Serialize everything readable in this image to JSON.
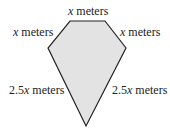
{
  "diagram": {
    "shape": "pentagon",
    "fill": "#e3e3e3",
    "stroke": "#222222",
    "vertices": [
      [
        70,
        21
      ],
      [
        105,
        21
      ],
      [
        126,
        48
      ],
      [
        86,
        126
      ],
      [
        48,
        48
      ]
    ],
    "labels": {
      "top": {
        "var": "x",
        "unit": " meters"
      },
      "upper_left": {
        "var": "x",
        "unit": " meters"
      },
      "upper_right": {
        "var": "x",
        "unit": " meters"
      },
      "lower_left": {
        "coef": "2.5",
        "var": "x",
        "unit": " meters"
      },
      "lower_right": {
        "coef": "2.5",
        "var": "x",
        "unit": " meters"
      }
    }
  }
}
